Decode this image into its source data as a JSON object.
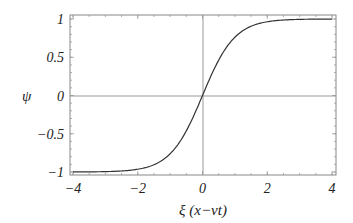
{
  "chart_data": {
    "type": "line",
    "title": "",
    "xlabel": "ξ (x−vt)",
    "ylabel": "ψ",
    "xlim": [
      -4,
      4
    ],
    "ylim": [
      -1,
      1
    ],
    "x_ticks": [
      "-4",
      "-2",
      "0",
      "2",
      "4"
    ],
    "y_ticks": [
      "1",
      "0.5",
      "0",
      "-0.5",
      "-1"
    ],
    "x_tick_labels": [
      "−4",
      "−2",
      "0",
      "2",
      "4"
    ],
    "y_tick_labels": [
      "1",
      "0.5",
      "0",
      "−0.5",
      "−1"
    ],
    "grid": false,
    "axes_lines_through_origin": true,
    "series": [
      {
        "name": "ψ = tanh(ξ)",
        "x": [
          -4,
          -3.5,
          -3,
          -2.5,
          -2,
          -1.5,
          -1,
          -0.5,
          0,
          0.5,
          1,
          1.5,
          2,
          2.5,
          3,
          3.5,
          4
        ],
        "values": [
          -0.999,
          -0.998,
          -0.995,
          -0.987,
          -0.964,
          -0.905,
          -0.762,
          -0.462,
          0,
          0.462,
          0.762,
          0.905,
          0.964,
          0.987,
          0.995,
          0.998,
          0.999
        ],
        "color": "#333333"
      }
    ]
  }
}
